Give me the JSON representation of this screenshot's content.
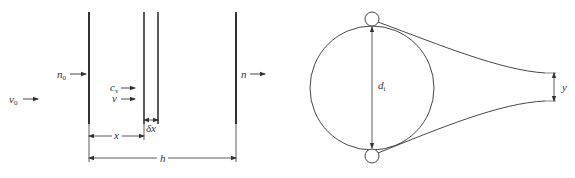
{
  "left_figure": {
    "labels": {
      "v0": "v",
      "v0_sub": "0",
      "n0": "n",
      "n0_sub": "0",
      "cv": "c",
      "cv_sub": "v",
      "v": "v",
      "n": "n",
      "x": "x",
      "dx": "δx",
      "h": "h"
    }
  },
  "right_figure": {
    "labels": {
      "di": "d",
      "di_sub": "i",
      "y": "y"
    }
  },
  "colors": {
    "line": "#333333",
    "background": "#ffffff"
  }
}
